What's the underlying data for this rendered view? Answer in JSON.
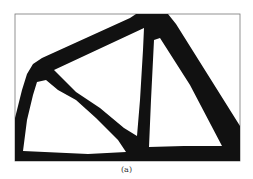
{
  "figure": {
    "label": "(a)",
    "colors": {
      "material": "#111111",
      "void": "#ffffff",
      "frame": "#777777"
    }
  }
}
